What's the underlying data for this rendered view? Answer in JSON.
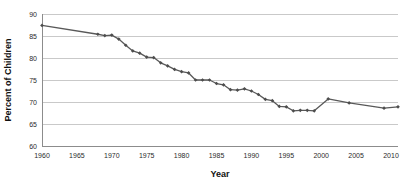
{
  "chart_data": {
    "type": "line",
    "title": "",
    "xlabel": "Year",
    "ylabel": "Percent of Children",
    "xlim": [
      1960,
      2011
    ],
    "ylim": [
      60,
      90
    ],
    "xticks": [
      1960,
      1965,
      1970,
      1975,
      1980,
      1985,
      1990,
      1995,
      2000,
      2005,
      2010
    ],
    "yticks": [
      60,
      65,
      70,
      75,
      80,
      85,
      90
    ],
    "xtick_labels": [
      "1960",
      "1965",
      "1970",
      "1975",
      "1980",
      "1985",
      "1990",
      "1995",
      "2000",
      "2005",
      "2010"
    ],
    "ytick_labels": [
      "60",
      "65",
      "70",
      "75",
      "80",
      "85",
      "90"
    ],
    "grid": true,
    "grid_axis": "y",
    "legend": false,
    "legend_position": "none",
    "marker": "diamond",
    "line_color": "#595959",
    "marker_color": "#4d4d4d",
    "grid_color": "#c9c9c9",
    "axis_color": "#8c8c8c",
    "background_color": "#ffffff",
    "x": [
      1960,
      1968,
      1969,
      1970,
      1971,
      1972,
      1973,
      1974,
      1975,
      1976,
      1977,
      1978,
      1979,
      1980,
      1981,
      1982,
      1983,
      1984,
      1985,
      1986,
      1987,
      1988,
      1989,
      1990,
      1991,
      1992,
      1993,
      1994,
      1995,
      1996,
      1997,
      1998,
      1999,
      2001,
      2004,
      2009,
      2011
    ],
    "values": [
      87.4,
      85.4,
      85.1,
      85.2,
      84.3,
      82.9,
      81.6,
      81.1,
      80.2,
      80.1,
      78.9,
      78.2,
      77.4,
      76.9,
      76.6,
      75.0,
      75.0,
      75.0,
      74.2,
      73.9,
      72.8,
      72.7,
      73.0,
      72.5,
      71.7,
      70.6,
      70.3,
      69.0,
      68.9,
      68.0,
      68.1,
      68.1,
      68.0,
      70.7,
      69.8,
      68.6,
      68.9
    ],
    "series": [
      {
        "name": "Percent of Children",
        "x": [
          1960,
          1968,
          1969,
          1970,
          1971,
          1972,
          1973,
          1974,
          1975,
          1976,
          1977,
          1978,
          1979,
          1980,
          1981,
          1982,
          1983,
          1984,
          1985,
          1986,
          1987,
          1988,
          1989,
          1990,
          1991,
          1992,
          1993,
          1994,
          1995,
          1996,
          1997,
          1998,
          1999,
          2001,
          2004,
          2009,
          2011
        ],
        "values": [
          87.4,
          85.4,
          85.1,
          85.2,
          84.3,
          82.9,
          81.6,
          81.1,
          80.2,
          80.1,
          78.9,
          78.2,
          77.4,
          76.9,
          76.6,
          75.0,
          75.0,
          75.0,
          74.2,
          73.9,
          72.8,
          72.7,
          73.0,
          72.5,
          71.7,
          70.6,
          70.3,
          69.0,
          68.9,
          68.0,
          68.1,
          68.1,
          68.0,
          70.7,
          69.8,
          68.6,
          68.9
        ]
      }
    ],
    "annotations": []
  },
  "layout": {
    "plot_left": 42,
    "plot_right": 398,
    "plot_top": 14,
    "plot_bottom": 146,
    "x_axis_title_y": 177,
    "y_axis_title_x": 11
  }
}
